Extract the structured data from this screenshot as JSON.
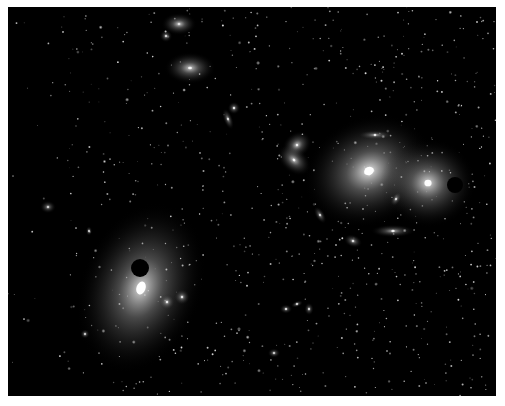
{
  "image": {
    "description": "Astronomical image of a galaxy cluster field with elliptical galaxies and occulting masks",
    "background": "#000000",
    "border_color": "#ffffff"
  },
  "galaxies": [
    {
      "name": "giant-elliptical-right-center",
      "cx": 369,
      "cy": 171,
      "rx": 42,
      "ry": 34,
      "rot": -25,
      "core": 1.0,
      "halo": 0.55
    },
    {
      "name": "giant-elliptical-far-right",
      "cx": 428,
      "cy": 183,
      "rx": 30,
      "ry": 28,
      "rot": 0,
      "core": 0.95,
      "halo": 0.5
    },
    {
      "name": "giant-elliptical-lower-left",
      "cx": 141,
      "cy": 288,
      "rx": 38,
      "ry": 55,
      "rot": 20,
      "core": 1.0,
      "halo": 0.5
    },
    {
      "name": "elliptical-top",
      "cx": 190,
      "cy": 68,
      "rx": 16,
      "ry": 10,
      "rot": 0,
      "core": 0.85,
      "halo": 0.45
    },
    {
      "name": "elliptical-top-edge",
      "cx": 179,
      "cy": 24,
      "rx": 11,
      "ry": 7,
      "rot": 0,
      "core": 0.6,
      "halo": 0.45
    },
    {
      "name": "small-top-left",
      "cx": 166,
      "cy": 36,
      "rx": 4,
      "ry": 4,
      "rot": 0,
      "core": 0.7,
      "halo": 0.3
    },
    {
      "name": "pair-center-a",
      "cx": 297,
      "cy": 145,
      "rx": 10,
      "ry": 8,
      "rot": -40,
      "core": 0.85,
      "halo": 0.45
    },
    {
      "name": "pair-center-b",
      "cx": 294,
      "cy": 160,
      "rx": 12,
      "ry": 8,
      "rot": 40,
      "core": 0.85,
      "halo": 0.45
    },
    {
      "name": "small-pair-upper-a",
      "cx": 234,
      "cy": 108,
      "rx": 4,
      "ry": 4,
      "rot": 0,
      "core": 0.8,
      "halo": 0.35
    },
    {
      "name": "small-pair-upper-b",
      "cx": 228,
      "cy": 119,
      "rx": 3,
      "ry": 7,
      "rot": -20,
      "core": 0.7,
      "halo": 0.35
    },
    {
      "name": "edge-on-top",
      "cx": 375,
      "cy": 135,
      "rx": 11,
      "ry": 3,
      "rot": 0,
      "core": 0.85,
      "halo": 0.3
    },
    {
      "name": "edge-on-lower",
      "cx": 393,
      "cy": 231,
      "rx": 14,
      "ry": 4,
      "rot": 0,
      "core": 0.85,
      "halo": 0.35
    },
    {
      "name": "small-ellipse-mid",
      "cx": 353,
      "cy": 241,
      "rx": 6,
      "ry": 4,
      "rot": 20,
      "core": 0.75,
      "halo": 0.35
    },
    {
      "name": "small-ellipse-mid-2",
      "cx": 320,
      "cy": 215,
      "rx": 3,
      "ry": 6,
      "rot": -30,
      "core": 0.7,
      "halo": 0.3
    },
    {
      "name": "small-ellipse-right",
      "cx": 396,
      "cy": 199,
      "rx": 3,
      "ry": 5,
      "rot": 30,
      "core": 0.7,
      "halo": 0.3
    },
    {
      "name": "left-edge-galaxy",
      "cx": 48,
      "cy": 207,
      "rx": 5,
      "ry": 4,
      "rot": 0,
      "core": 0.6,
      "halo": 0.3
    },
    {
      "name": "lower-left-companion-a",
      "cx": 167,
      "cy": 302,
      "rx": 5,
      "ry": 5,
      "rot": 0,
      "core": 0.8,
      "halo": 0.35
    },
    {
      "name": "lower-left-companion-b",
      "cx": 182,
      "cy": 297,
      "rx": 5,
      "ry": 5,
      "rot": 0,
      "core": 0.75,
      "halo": 0.35
    },
    {
      "name": "lower-group-a",
      "cx": 286,
      "cy": 309,
      "rx": 4,
      "ry": 3,
      "rot": 0,
      "core": 0.75,
      "halo": 0.3
    },
    {
      "name": "lower-group-b",
      "cx": 297,
      "cy": 304,
      "rx": 4,
      "ry": 2,
      "rot": -20,
      "core": 0.7,
      "halo": 0.3
    },
    {
      "name": "lower-group-c",
      "cx": 309,
      "cy": 309,
      "rx": 3,
      "ry": 4,
      "rot": 0,
      "core": 0.65,
      "halo": 0.3
    },
    {
      "name": "bottom-center",
      "cx": 274,
      "cy": 353,
      "rx": 4,
      "ry": 3,
      "rot": 0,
      "core": 0.6,
      "halo": 0.3
    },
    {
      "name": "lower-left-small",
      "cx": 85,
      "cy": 334,
      "rx": 3,
      "ry": 3,
      "rot": 0,
      "core": 0.6,
      "halo": 0.3
    },
    {
      "name": "left-small",
      "cx": 89,
      "cy": 231,
      "rx": 2,
      "ry": 3,
      "rot": 0,
      "core": 0.6,
      "halo": 0.3
    }
  ],
  "masks": [
    {
      "name": "occulting-disk-left",
      "cx": 140,
      "cy": 268,
      "r": 9
    },
    {
      "name": "occulting-disk-right",
      "cx": 455,
      "cy": 185,
      "r": 8
    }
  ],
  "star_field": {
    "count": 900,
    "seed": 7
  }
}
